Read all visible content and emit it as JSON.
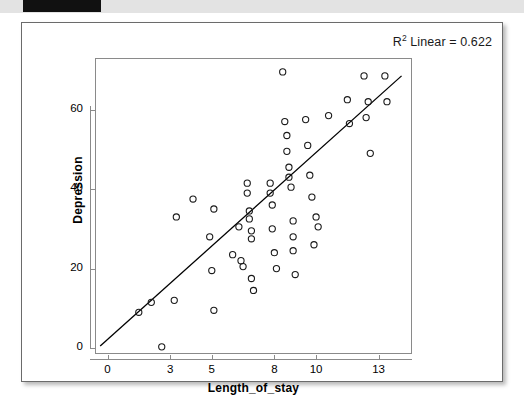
{
  "page": {
    "background_color": "#ffffff",
    "card_border_color": "#6b6b6b"
  },
  "annotation": {
    "r2_prefix": "R",
    "r2_sup": "2",
    "r2_text": " Linear = 0.622"
  },
  "chart_data": {
    "type": "scatter",
    "title": "",
    "subtitle": "",
    "xlabel": "Length_of_stay",
    "ylabel": "Depression",
    "xlim": [
      -0.6,
      14.6
    ],
    "ylim": [
      -1.5,
      73
    ],
    "xticks": [
      0,
      3,
      5,
      8,
      10,
      13
    ],
    "xtick_labels": [
      "0",
      "3",
      "5",
      "8",
      "10",
      "13"
    ],
    "yticks": [
      0,
      20,
      40,
      60
    ],
    "ytick_labels": [
      "0",
      "20",
      "40",
      "60"
    ],
    "grid": false,
    "legend": "none",
    "annotations": [
      "R² Linear = 0.622"
    ],
    "marker": {
      "shape": "open-circle",
      "radius": 3.1,
      "edge_color": "#1a1a1a",
      "fill": "none",
      "edge_width": 1.1
    },
    "fit_line": {
      "type": "linear",
      "color": "#000000",
      "width": 1.3,
      "r_squared": 0.622,
      "x_start": -0.35,
      "y_start": 0.5,
      "x_end": 14.1,
      "y_end": 68.5
    },
    "points": [
      [
        1.5,
        9.0
      ],
      [
        2.1,
        11.5
      ],
      [
        2.6,
        0.3
      ],
      [
        3.2,
        12.0
      ],
      [
        3.3,
        33.0
      ],
      [
        4.1,
        37.5
      ],
      [
        4.9,
        28.0
      ],
      [
        5.0,
        19.5
      ],
      [
        5.1,
        35.0
      ],
      [
        5.1,
        9.5
      ],
      [
        6.0,
        23.5
      ],
      [
        6.3,
        30.5
      ],
      [
        6.4,
        22.0
      ],
      [
        6.5,
        20.5
      ],
      [
        6.7,
        41.5
      ],
      [
        6.7,
        39.0
      ],
      [
        6.8,
        34.5
      ],
      [
        6.8,
        32.5
      ],
      [
        6.9,
        29.5
      ],
      [
        6.9,
        27.5
      ],
      [
        6.9,
        17.5
      ],
      [
        7.0,
        14.5
      ],
      [
        7.8,
        41.5
      ],
      [
        7.8,
        39.0
      ],
      [
        7.9,
        36.0
      ],
      [
        7.9,
        30.0
      ],
      [
        8.0,
        24.0
      ],
      [
        8.1,
        20.0
      ],
      [
        8.4,
        69.5
      ],
      [
        8.5,
        57.0
      ],
      [
        8.6,
        53.5
      ],
      [
        8.6,
        49.5
      ],
      [
        8.7,
        45.5
      ],
      [
        8.7,
        43.0
      ],
      [
        8.8,
        40.5
      ],
      [
        8.9,
        32.0
      ],
      [
        8.9,
        28.0
      ],
      [
        8.9,
        24.5
      ],
      [
        9.0,
        18.5
      ],
      [
        9.5,
        57.5
      ],
      [
        9.6,
        51.0
      ],
      [
        9.7,
        43.5
      ],
      [
        9.8,
        38.0
      ],
      [
        9.9,
        26.0
      ],
      [
        10.0,
        33.0
      ],
      [
        10.1,
        30.5
      ],
      [
        10.6,
        58.5
      ],
      [
        11.5,
        62.5
      ],
      [
        11.6,
        56.5
      ],
      [
        12.3,
        68.5
      ],
      [
        12.4,
        58.0
      ],
      [
        12.5,
        62.0
      ],
      [
        12.6,
        49.0
      ],
      [
        13.3,
        68.5
      ],
      [
        13.4,
        62.0
      ]
    ]
  }
}
